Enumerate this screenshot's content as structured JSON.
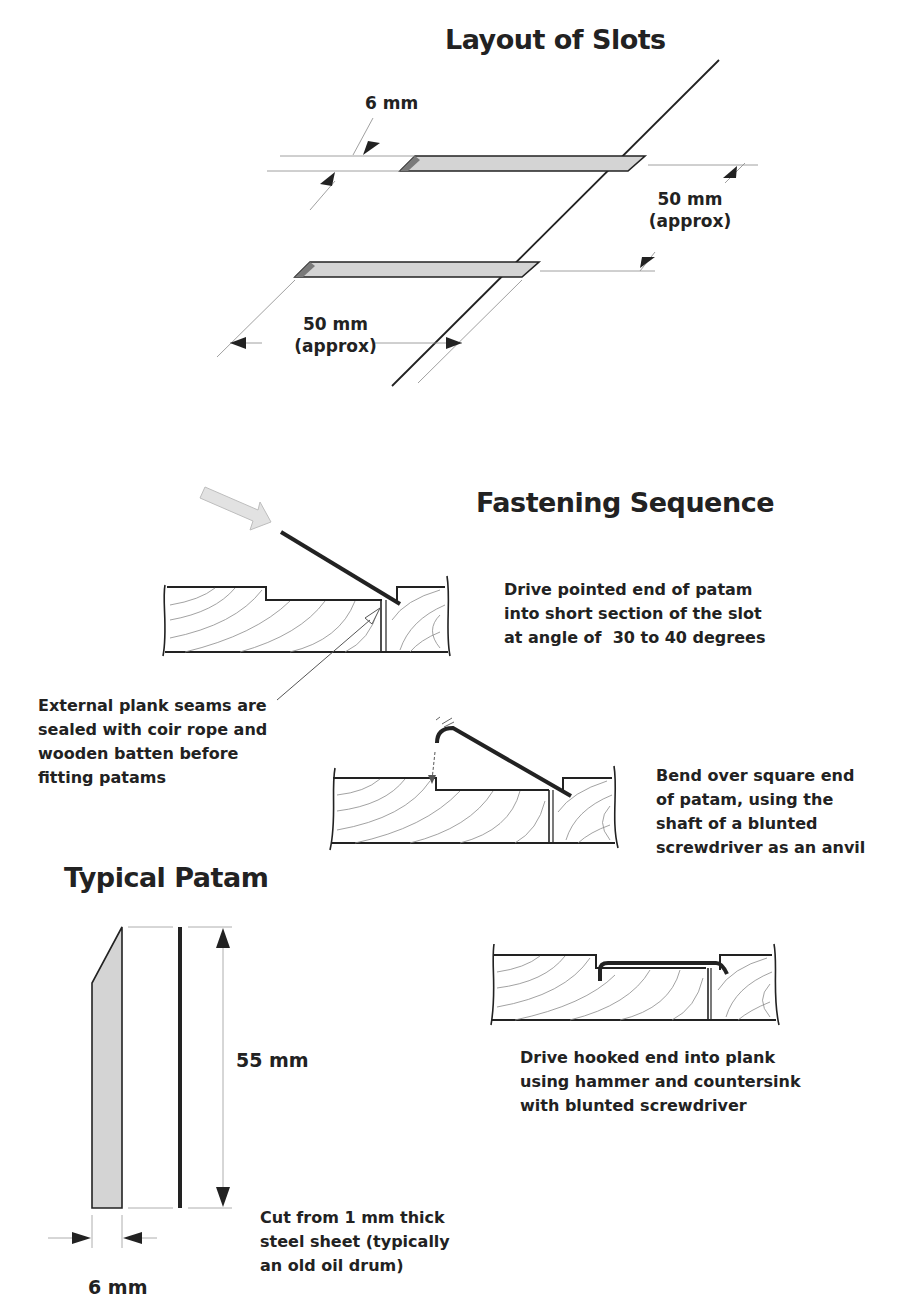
{
  "layout_of_slots": {
    "title": "Layout of Slots",
    "dim_slot_width": "6 mm",
    "dim_slot_spacing": {
      "line1": "50 mm",
      "line2": "(approx)"
    },
    "dim_slot_length": {
      "line1": "50 mm",
      "line2": "(approx)"
    }
  },
  "fastening_sequence": {
    "title": "Fastening Sequence",
    "steps": [
      {
        "caption": "Drive pointed end of patam\ninto short section of the slot\nat angle of  30 to 40 degrees"
      },
      {
        "caption": "Bend over square end\nof patam, using the\nshaft of a blunted\nscrewdriver as an anvil"
      },
      {
        "caption": "Drive hooked end into plank\nusing hammer and countersink\nwith blunted screwdriver"
      }
    ],
    "seam_note": "External plank seams are\nsealed with coir rope and\nwooden batten before\nfitting patams"
  },
  "typical_patam": {
    "title": "Typical Patam",
    "dim_length": "55 mm",
    "dim_width": "6 mm",
    "material_note": "Cut from 1 mm thick\nsteel sheet (typically\nan old oil drum)"
  },
  "colors": {
    "ink": "#222222",
    "slot_fill": "#d4d4d4",
    "slot_shadow": "#7a7a7a",
    "grain": "#8a8a8a",
    "arrow_fill": "#e2e2e2"
  }
}
